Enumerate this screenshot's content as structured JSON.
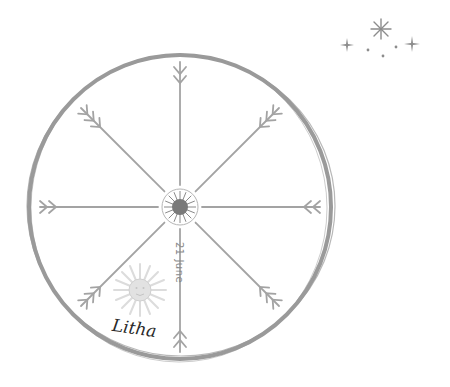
{
  "wheel": {
    "festival_name": "Litha",
    "date": "21 June",
    "spoke_count": 8,
    "ring_color": "#9a9a9a",
    "spoke_color": "#a3a3a3",
    "hub_color": "#7a7a7a",
    "sun_color": "#d9d9d9"
  },
  "decoration": {
    "sparkles": [
      "four-point-star",
      "eight-point-star",
      "four-point-star",
      "dot",
      "dot",
      "dot"
    ]
  }
}
